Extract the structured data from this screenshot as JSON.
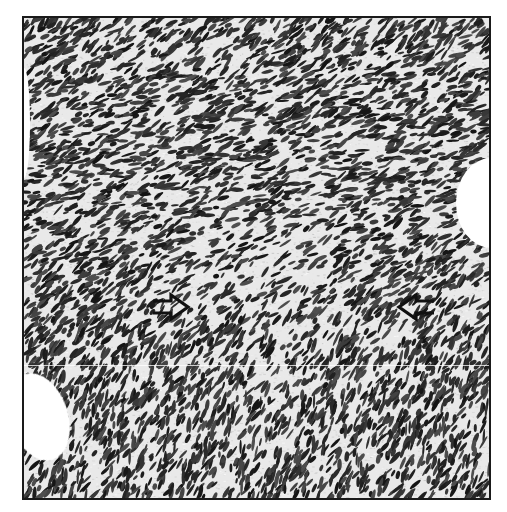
{
  "figure": {
    "type": "histology-micrograph",
    "stain": "grayscale (hematoxylin-like nuclei on pale stroma)",
    "colors": {
      "background": "#ffffff",
      "stroma": "#e9e9e9",
      "nuclei": "#2a2a2a",
      "frame": "#1a1a1a",
      "arrow_stroke": "#111111"
    },
    "annotations": [
      {
        "id": "arrow-left",
        "shape": "open-arrow",
        "direction": "right",
        "x": 150,
        "y": 290
      },
      {
        "id": "arrow-right",
        "shape": "open-arrow",
        "direction": "left",
        "x": 396,
        "y": 290
      }
    ],
    "features": [
      {
        "id": "vessel-right",
        "kind": "vascular-lumen",
        "position": "right edge, mid-upper"
      },
      {
        "id": "vessel-left",
        "kind": "vascular-lumen",
        "position": "left edge, lower"
      },
      {
        "id": "seam",
        "kind": "panel-join-line",
        "y": 363
      }
    ]
  }
}
